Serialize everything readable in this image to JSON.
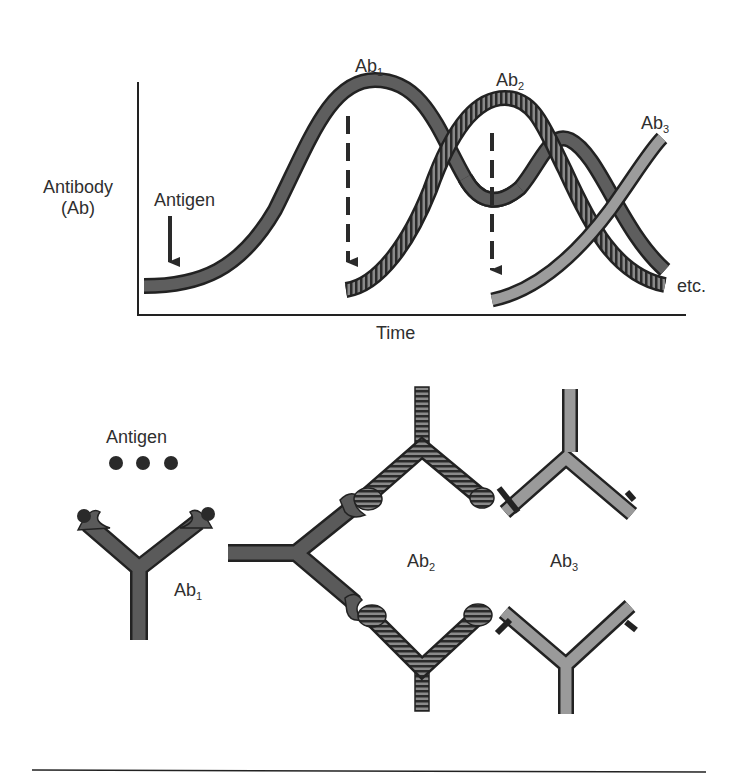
{
  "graph": {
    "y_axis_label_line1": "Antibody",
    "y_axis_label_line2": "(Ab)",
    "x_axis_label": "Time",
    "antigen_marker": "Antigen",
    "curves": [
      {
        "name": "Ab",
        "sub": "1",
        "style": "solid-dark"
      },
      {
        "name": "Ab",
        "sub": "2",
        "style": "hatched"
      },
      {
        "name": "Ab",
        "sub": "3",
        "style": "solid-light"
      }
    ],
    "continuation_label": "etc."
  },
  "network": {
    "antigen_label": "Antigen",
    "antigen_count": 3,
    "ab1": {
      "name": "Ab",
      "sub": "1"
    },
    "ab2": {
      "name": "Ab",
      "sub": "2"
    },
    "ab3": {
      "name": "Ab",
      "sub": "3"
    }
  },
  "colors": {
    "ab1_fill": "#5a5a5a",
    "ab2_fill": "#6a6a6a",
    "ab3_fill": "#9a9a9a",
    "outline": "#222222",
    "text": "#2f2f2f"
  }
}
